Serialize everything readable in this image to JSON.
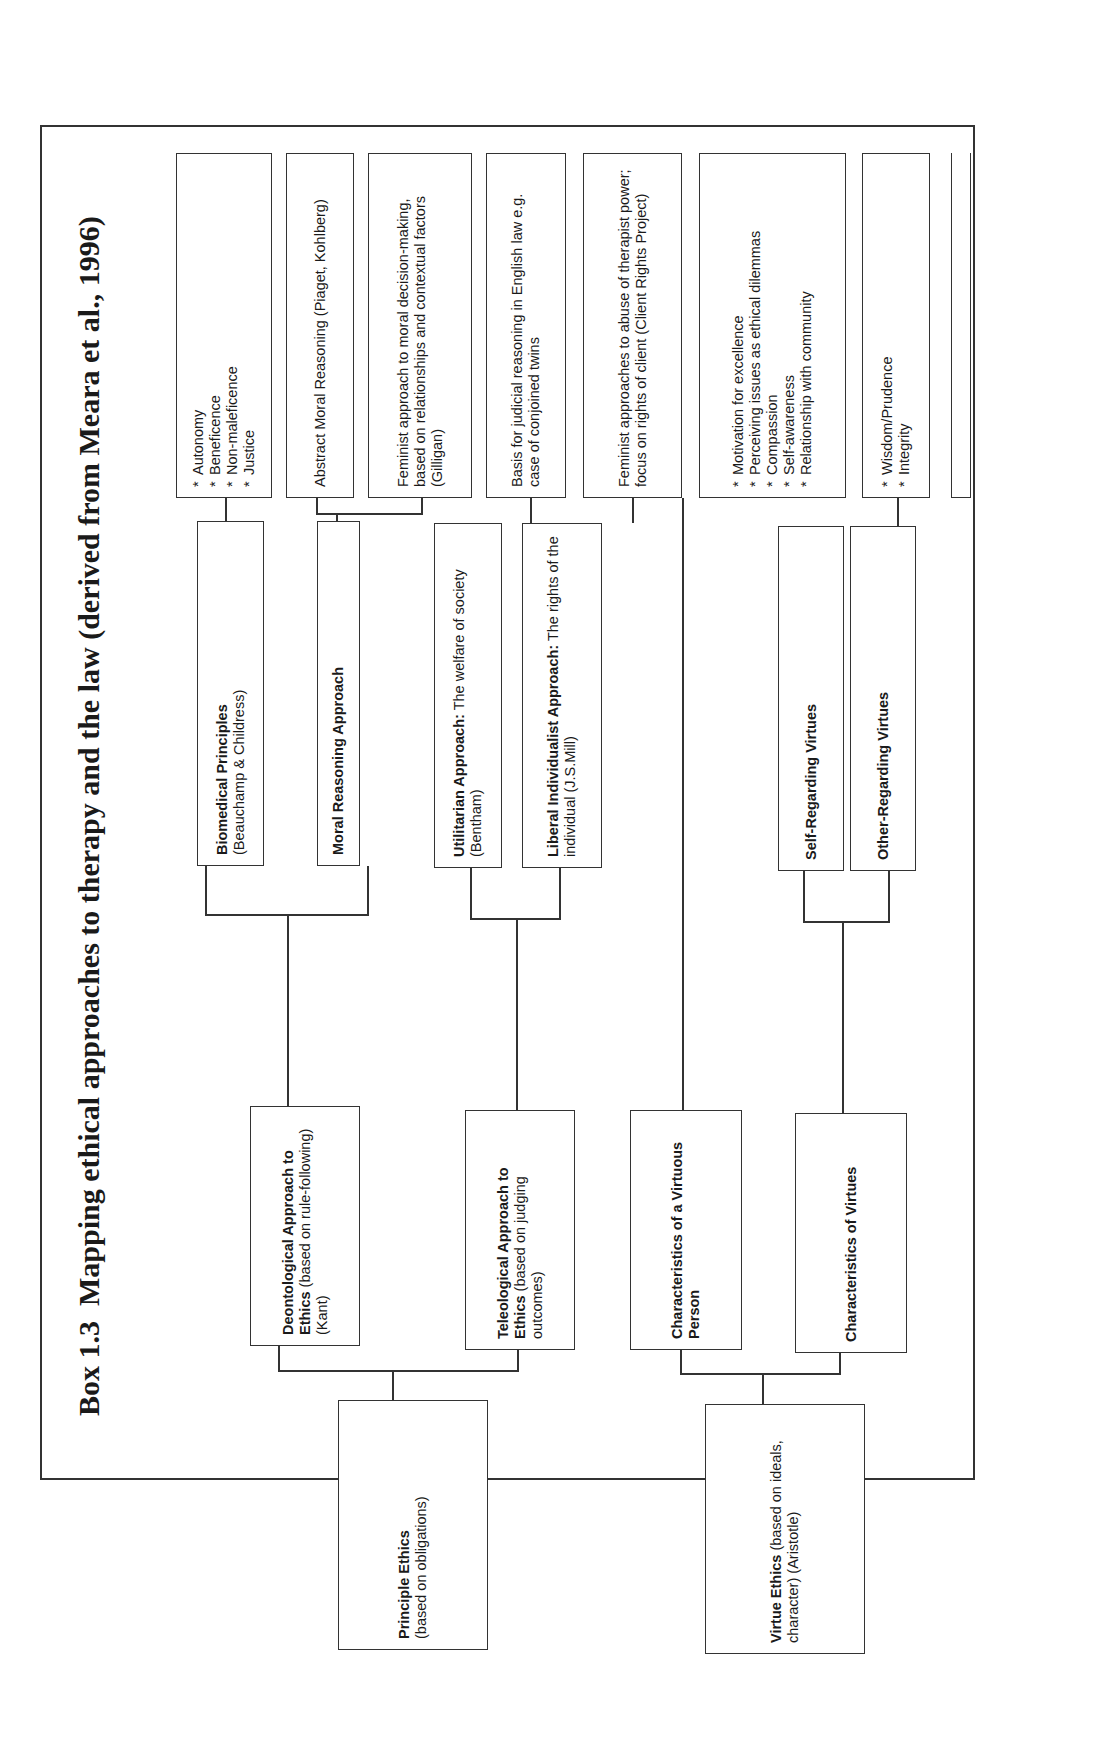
{
  "title": {
    "number": "Box 1.3",
    "text": "Mapping ethical approaches to therapy and the law (derived from Meara et al., 1996)"
  },
  "roots": {
    "principle": {
      "bold": "Principle Ethics",
      "rest": "(based on obligations)"
    },
    "virtue": {
      "bold": "Virtue Ethics",
      "rest": "(based on ideals, character) (Aristotle)"
    }
  },
  "tier2": {
    "deontological": {
      "bold": "Deontological Approach to Ethics",
      "rest": "(based on rule-following) (Kant)"
    },
    "teleological": {
      "bold": "Teleological Approach to Ethics",
      "rest": "(based on judging outcomes)"
    },
    "virtuous_person": {
      "bold": "Characteristics of a Virtuous Person",
      "rest": ""
    },
    "char_virtues": {
      "bold": "Characteristics of Virtues",
      "rest": ""
    }
  },
  "tier3": {
    "biomedical": {
      "bold": "Biomedical Principles",
      "rest": "(Beauchamp & Childress)"
    },
    "moral_reasoning": {
      "bold": "Moral Reasoning Approach",
      "rest": ""
    },
    "utilitarian": {
      "bold": "Utilitarian Approach:",
      "rest": "The welfare of society (Bentham)"
    },
    "liberal": {
      "bold": "Liberal Individualist Approach:",
      "rest": "The rights of the individual (J.S.Mill)"
    },
    "self_regarding": {
      "bold": "Self-Regarding Virtues",
      "rest": ""
    },
    "other_regarding": {
      "bold": "Other-Regarding Virtues",
      "rest": ""
    }
  },
  "leaves": {
    "biomedical_list": [
      "Autonomy",
      "Beneficence",
      "Non-maleficence",
      "Justice"
    ],
    "abstract_moral": "Abstract Moral Reasoning (Piaget, Kohlberg)",
    "feminist_moral": "Feminist approach to moral decision-making, based on relationships and contextual factors (Gilligan)",
    "judicial": "Basis for judicial reasoning in English law e.g. case of conjoined twins",
    "feminist_abuse": "Feminist approaches to abuse of therapist power; focus on rights of client (Client Rights Project)",
    "virtuous_list": [
      "Motivation for excellence",
      "Perceiving issues as ethical dilemmas",
      "Compassion",
      "Self-awareness",
      "Relationship with community"
    ],
    "self_list": [
      "Wisdom/Prudence",
      "Integrity"
    ],
    "other_list": [
      "Respectfulness",
      "Benevolence"
    ]
  }
}
